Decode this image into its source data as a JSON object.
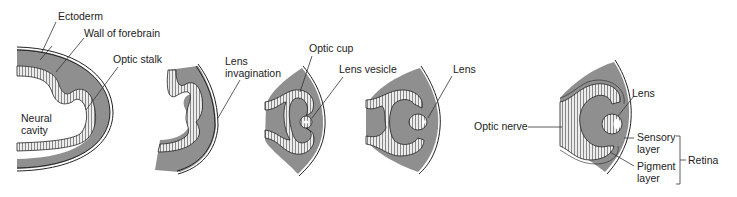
{
  "diagram": {
    "colors": {
      "tissue": "#8f8f8f",
      "neural_layer": "#e8e8e8",
      "outline": "#222222",
      "background": "#ffffff"
    },
    "panels": [
      {
        "id": 1,
        "labels": {
          "ectoderm": "Ectoderm",
          "forebrain": "Wall of forebrain",
          "optic_stalk": "Optic stalk",
          "neural": "Neural",
          "cavity": "cavity"
        }
      },
      {
        "id": 2,
        "labels": {
          "lens1": "Lens",
          "lens2": "invagination"
        }
      },
      {
        "id": 3,
        "labels": {
          "optic_cup": "Optic cup",
          "lens_vesicle": "Lens vesicle"
        }
      },
      {
        "id": 4,
        "labels": {
          "lens": "Lens"
        }
      },
      {
        "id": 5,
        "labels": {
          "lens": "Lens",
          "optic_nerve": "Optic nerve",
          "sensory1": "Sensory",
          "sensory2": "layer",
          "pigment1": "Pigment",
          "pigment2": "layer",
          "retina": "Retina"
        }
      }
    ]
  }
}
